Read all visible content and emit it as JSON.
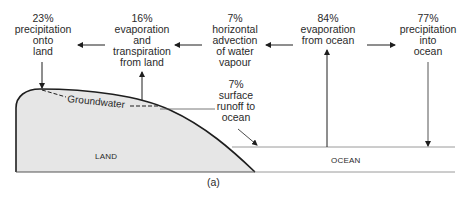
{
  "labels": {
    "precip_land": {
      "pct": "23%",
      "lines": [
        "precipitation",
        "onto",
        "land"
      ]
    },
    "evap_land": {
      "pct": "16%",
      "lines": [
        "evaporation",
        "and",
        "transpiration",
        "from land"
      ]
    },
    "advection": {
      "pct": "7%",
      "lines": [
        "horizontal",
        "advection",
        "of water",
        "vapour"
      ]
    },
    "runoff": {
      "pct": "7%",
      "lines": [
        "surface",
        "runoff to",
        "ocean"
      ]
    },
    "evap_ocean": {
      "pct": "84%",
      "lines": [
        "evaporation",
        "from ocean"
      ]
    },
    "precip_ocean": {
      "pct": "77%",
      "lines": [
        "precipitation",
        "into",
        "ocean"
      ]
    }
  },
  "regions": {
    "land": "LAND",
    "ocean": "OCEAN",
    "groundwater": "Groundwater"
  },
  "caption": "(a)",
  "colors": {
    "land_fill": "#e6e6e6",
    "stroke": "#1e1e1e",
    "ocean_line": "#9a9a9a",
    "text": "#2a2a2a"
  }
}
